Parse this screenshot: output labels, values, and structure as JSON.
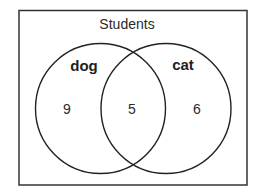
{
  "diagram": {
    "type": "venn",
    "universe_label": "Students",
    "sets": [
      {
        "name": "dog",
        "only_count": "9"
      },
      {
        "name": "cat",
        "only_count": "6"
      }
    ],
    "intersection": {
      "sets": [
        "dog",
        "cat"
      ],
      "count": "5"
    },
    "colors": {
      "stroke": "#2a2a2a",
      "background": "#ffffff",
      "text": "#1e1e1e"
    }
  }
}
